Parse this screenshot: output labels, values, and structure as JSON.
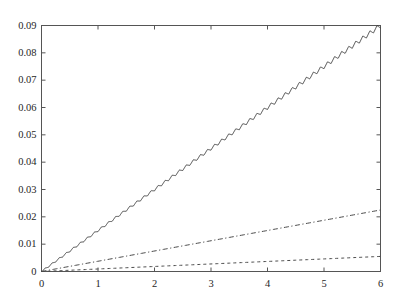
{
  "chart_data": {
    "type": "line",
    "title": "",
    "xlabel": "",
    "ylabel": "",
    "xlim": [
      0,
      6
    ],
    "ylim": [
      0,
      0.09
    ],
    "grid": false,
    "legend": null,
    "xticks": [
      0,
      1,
      2,
      3,
      4,
      5,
      6
    ],
    "xtick_labels": [
      "0",
      "1",
      "2",
      "3",
      "4",
      "5",
      "6"
    ],
    "yticks": [
      0,
      0.01,
      0.02,
      0.03,
      0.04,
      0.05,
      0.06,
      0.07,
      0.08,
      0.09
    ],
    "ytick_labels": [
      "0",
      "0.01",
      "0.02",
      "0.03",
      "0.04",
      "0.05",
      "0.06",
      "0.07",
      "0.08",
      "0.09"
    ],
    "box": true,
    "tick_direction": "in",
    "axis_color": "#555555",
    "background": "#ffffff",
    "series": [
      {
        "name": "series-1",
        "style": "solid",
        "color": "#333333",
        "description": "steep near-linear rise with small sawtooth oscillation",
        "slope": 0.015,
        "oscillation_amplitude": 0.0009,
        "oscillation_period": 0.125,
        "x": [
          0,
          0.5,
          1,
          1.5,
          2,
          2.5,
          3,
          3.5,
          4,
          4.5,
          5,
          5.5,
          6
        ],
        "y": [
          0,
          0.0075,
          0.015,
          0.0225,
          0.03,
          0.0375,
          0.045,
          0.0525,
          0.06,
          0.0675,
          0.075,
          0.0825,
          0.09
        ]
      },
      {
        "name": "series-2",
        "style": "dashdot",
        "color": "#4a4a4a",
        "description": "shallow linear rise",
        "slope": 0.00375,
        "x": [
          0,
          1,
          2,
          3,
          4,
          5,
          6
        ],
        "y": [
          0,
          0.00375,
          0.0075,
          0.01125,
          0.015,
          0.01875,
          0.0225
        ]
      },
      {
        "name": "series-3",
        "style": "dashed",
        "color": "#4a4a4a",
        "description": "very shallow linear rise",
        "slope": 0.00092,
        "x": [
          0,
          1,
          2,
          3,
          4,
          5,
          6
        ],
        "y": [
          0,
          0.00092,
          0.00183,
          0.00275,
          0.00367,
          0.00458,
          0.0055
        ]
      }
    ]
  }
}
